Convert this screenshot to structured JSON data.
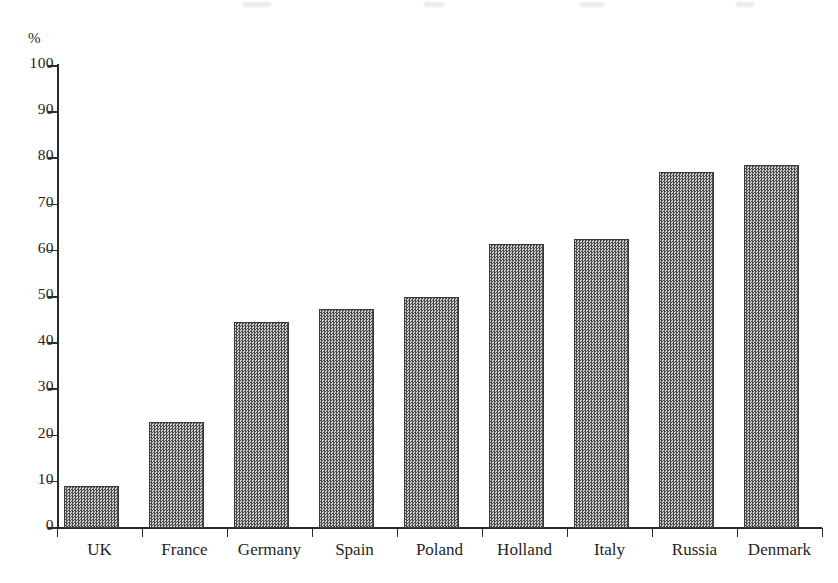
{
  "chart_data": {
    "type": "bar",
    "title": "",
    "xlabel": "",
    "ylabel": "%",
    "ylim": [
      0,
      100
    ],
    "grid": false,
    "legend": null,
    "categories": [
      "UK",
      "France",
      "Germany",
      "Spain",
      "Poland",
      "Holland",
      "Italy",
      "Russia",
      "Denmark"
    ],
    "values": [
      9,
      23,
      44.5,
      47.5,
      50,
      61.5,
      62.5,
      77,
      78.5
    ],
    "y_ticks": [
      "0",
      "10",
      "20",
      "30",
      "40",
      "50",
      "60",
      "70",
      "80",
      "90",
      "100"
    ],
    "y_tick_values": [
      0,
      10,
      20,
      30,
      40,
      50,
      60,
      70,
      80,
      90,
      100
    ],
    "bar_color": "#8e8e8e",
    "bar_edge_color": "#3a3a3a",
    "axis_color": "#2b2b2b",
    "background_color": "#ffffff"
  }
}
